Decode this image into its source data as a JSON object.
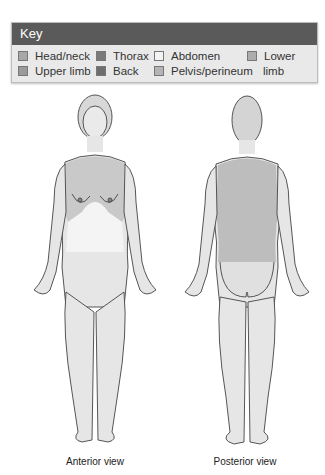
{
  "key": {
    "title": "Key",
    "items": [
      {
        "label": "Head/neck",
        "color": "#a8a8a8"
      },
      {
        "label": "Upper limb",
        "color": "#9a9a9a"
      },
      {
        "label": "Thorax",
        "color": "#7a7a7a"
      },
      {
        "label": "Back",
        "color": "#6e6e6e"
      },
      {
        "label": "Abdomen",
        "color": "#f4f4f4"
      },
      {
        "label": "Pelvis/perineum",
        "color": "#b4b4b4"
      },
      {
        "label": "Lower",
        "color": "#acacac"
      },
      {
        "label": "limb",
        "color": null
      }
    ]
  },
  "figures": {
    "anterior": {
      "caption": "Anterior view"
    },
    "posterior": {
      "caption": "Posterior view"
    }
  },
  "colors": {
    "skin": "#e6e6e6",
    "thorax": "#c9c9c9",
    "back": "#bdbdbd",
    "abdomen": "#f4f4f4",
    "outline": "#444444"
  }
}
